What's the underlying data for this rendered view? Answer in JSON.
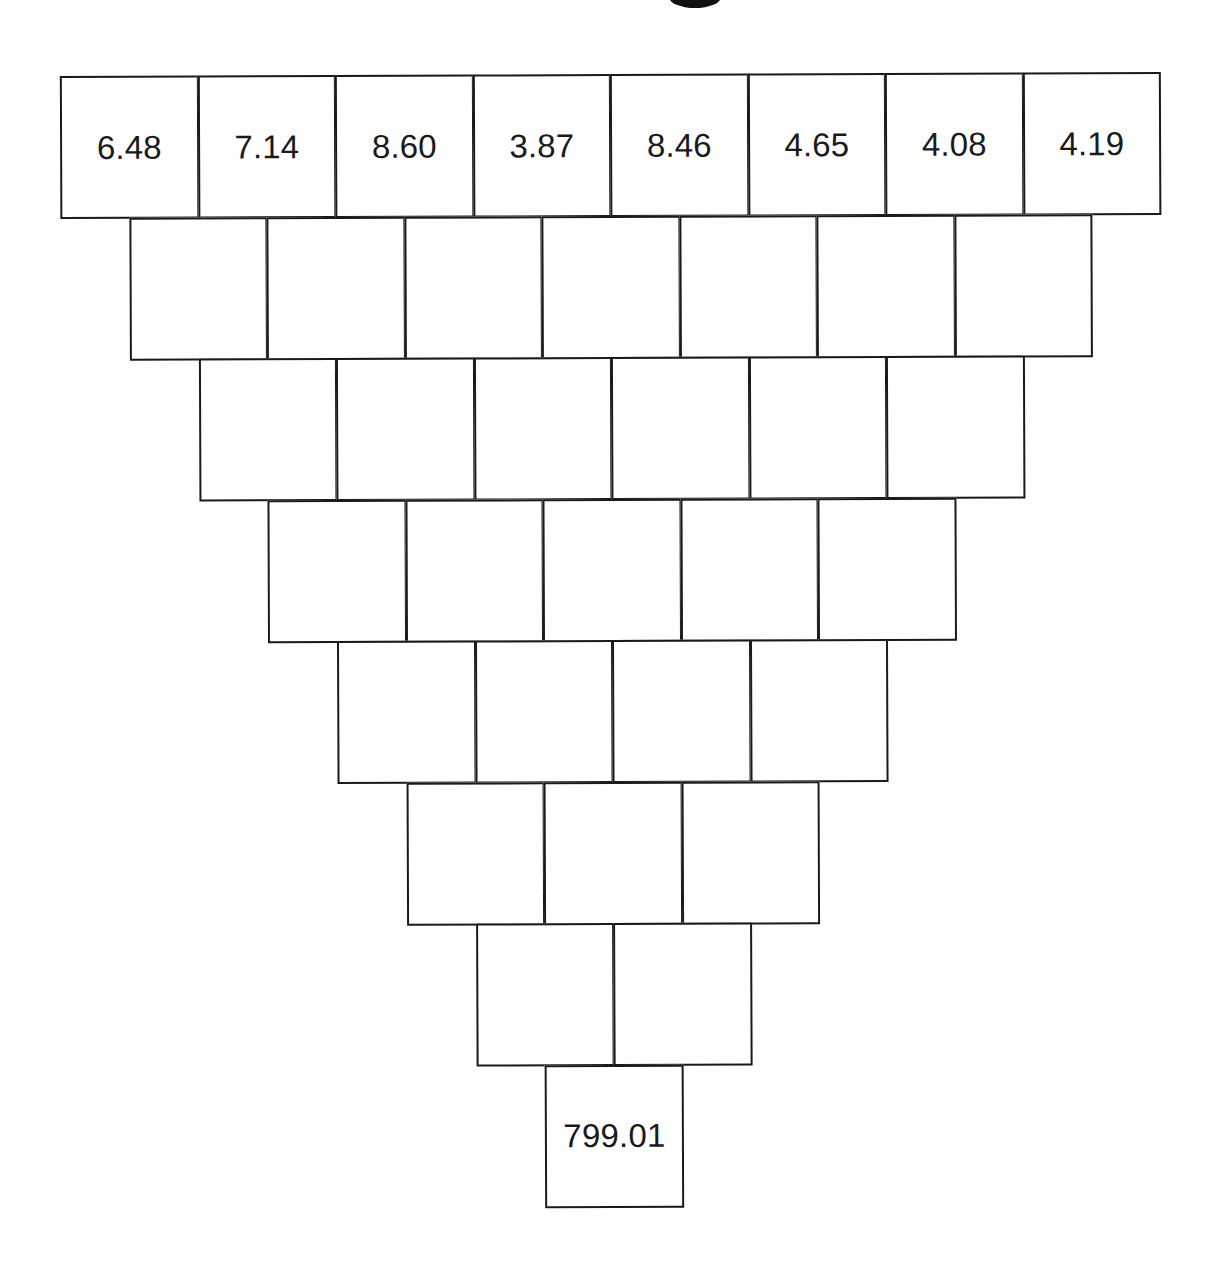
{
  "diagram": {
    "type": "inverted-number-pyramid",
    "layout": {
      "origin_x": 62,
      "origin_y": 74,
      "cell_width": 137.5,
      "cell_height": 141.5,
      "row_indent": 68.75
    },
    "rows": [
      {
        "cells": [
          "6.48",
          "7.14",
          "8.60",
          "3.87",
          "8.46",
          "4.65",
          "4.08",
          "4.19"
        ]
      },
      {
        "cells": [
          "",
          "",
          "",
          "",
          "",
          "",
          ""
        ]
      },
      {
        "cells": [
          "",
          "",
          "",
          "",
          "",
          ""
        ]
      },
      {
        "cells": [
          "",
          "",
          "",
          "",
          ""
        ]
      },
      {
        "cells": [
          "",
          "",
          "",
          ""
        ]
      },
      {
        "cells": [
          "",
          "",
          ""
        ]
      },
      {
        "cells": [
          "",
          ""
        ]
      },
      {
        "cells": [
          "799.01"
        ]
      }
    ]
  },
  "colors": {
    "line": "#1a1a1a",
    "text": "#1a1a1a",
    "background": "#ffffff"
  }
}
